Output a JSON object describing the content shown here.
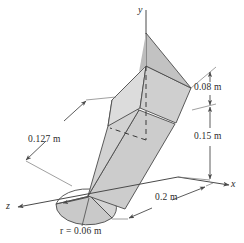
{
  "figure": {
    "kind": "engineering-3d-sheet-diagram",
    "background_color": "#ffffff",
    "line_color": "#4a4a4a",
    "face_color_light": "#d9d9d9",
    "face_color_mid": "#c9c9c9",
    "face_color_dark": "#bdbdbd",
    "text_color": "#2b2b2b"
  },
  "axes": {
    "y_label": "y",
    "x_label": "x",
    "z_label": "z"
  },
  "dimensions": [
    {
      "id": "dim-008",
      "label": "0.08 m",
      "value": 0.08,
      "unit": "m",
      "orientation": "vertical"
    },
    {
      "id": "dim-015",
      "label": "0.15 m",
      "value": 0.15,
      "unit": "m",
      "orientation": "vertical"
    },
    {
      "id": "dim-0127",
      "label": "0.127 m",
      "value": 0.127,
      "unit": "m",
      "orientation": "oblique"
    },
    {
      "id": "dim-02",
      "label": "0.2 m",
      "value": 0.2,
      "unit": "m",
      "orientation": "oblique"
    },
    {
      "id": "dim-radius",
      "label": "r = 0.06 m",
      "value": 0.06,
      "unit": "m",
      "orientation": "radius"
    }
  ]
}
